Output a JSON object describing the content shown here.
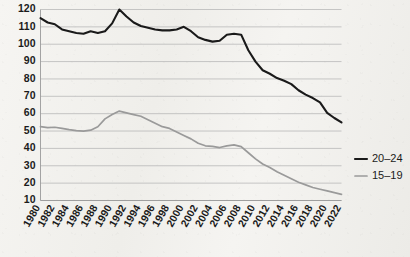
{
  "chart_data": {
    "type": "line",
    "title": "",
    "subtitle": "",
    "xlabel": "",
    "ylabel": "",
    "xlim": [
      1980,
      2022
    ],
    "ylim": [
      10,
      120
    ],
    "ytick_step": 10,
    "xtick_step": 2,
    "grid": true,
    "legend_position": "right",
    "yticks": [
      10,
      20,
      30,
      40,
      50,
      60,
      70,
      80,
      90,
      100,
      110,
      120
    ],
    "ytick_labels": [
      "10",
      "20",
      "30",
      "40",
      "50",
      "60",
      "70",
      "80",
      "90",
      "100",
      "110",
      "120"
    ],
    "xticks": [
      1980,
      1982,
      1984,
      1986,
      1988,
      1990,
      1992,
      1994,
      1996,
      1998,
      2000,
      2002,
      2004,
      2006,
      2008,
      2010,
      2012,
      2014,
      2016,
      2018,
      2020,
      2022
    ],
    "xtick_labels": [
      "1980",
      "1982",
      "1984",
      "1986",
      "1988",
      "1990",
      "1992",
      "1994",
      "1996",
      "1998",
      "2000",
      "2002",
      "2004",
      "2006",
      "2008",
      "2010",
      "2012",
      "2014",
      "2016",
      "2018",
      "2020",
      "2022"
    ],
    "x": [
      1980,
      1981,
      1982,
      1983,
      1984,
      1985,
      1986,
      1987,
      1988,
      1989,
      1990,
      1991,
      1992,
      1993,
      1994,
      1995,
      1996,
      1997,
      1998,
      1999,
      2000,
      2001,
      2002,
      2003,
      2004,
      2005,
      2006,
      2007,
      2008,
      2009,
      2010,
      2011,
      2012,
      2013,
      2014,
      2015,
      2016,
      2017,
      2018,
      2019,
      2020,
      2021,
      2022
    ],
    "series": [
      {
        "name": "20–24",
        "color": "#1a1a1a",
        "width": 2.1,
        "values": [
          115,
          112.5,
          111.5,
          108.5,
          107.5,
          106.5,
          106,
          107.5,
          106.5,
          107.5,
          112,
          120,
          116,
          112.5,
          110.5,
          109.5,
          108.5,
          108,
          108,
          108.5,
          110,
          107.5,
          104,
          102.5,
          101.5,
          102,
          105.5,
          106,
          105.5,
          96.5,
          90,
          85,
          83,
          80.5,
          79,
          77,
          73.5,
          71,
          69,
          66.5,
          60.5,
          57.5,
          55
        ]
      },
      {
        "name": "15–19",
        "color": "#9a9a9a",
        "width": 1.7,
        "values": [
          52.5,
          52,
          52.2,
          51.5,
          50.8,
          50.2,
          50,
          50.5,
          52.5,
          57,
          59.5,
          61.5,
          60.5,
          59.5,
          58.5,
          56.5,
          54.5,
          52.5,
          51.5,
          49.5,
          47.5,
          45.5,
          43,
          41.5,
          41.2,
          40.5,
          41.5,
          42,
          41,
          37.5,
          34,
          31,
          29,
          26.5,
          24.5,
          22.5,
          20.5,
          19,
          17.5,
          16.5,
          15.5,
          14.5,
          13.5
        ]
      }
    ],
    "legend": [
      {
        "label": "20–24",
        "color": "#1a1a1a",
        "width": 2.1
      },
      {
        "label": "15–19",
        "color": "#9a9a9a",
        "width": 1.7
      }
    ]
  }
}
